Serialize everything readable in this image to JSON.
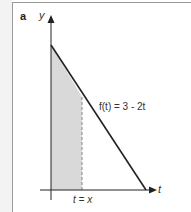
{
  "panel_label": "a",
  "axes": {
    "y_label": "y",
    "x_label": "t"
  },
  "function_label": "f(t) = 3 - 2t",
  "marker_label": "t = x",
  "colors": {
    "shade": "#d9d9d9",
    "line": "#222222",
    "dashed": "#888888",
    "frame": "#9a9a9a"
  }
}
